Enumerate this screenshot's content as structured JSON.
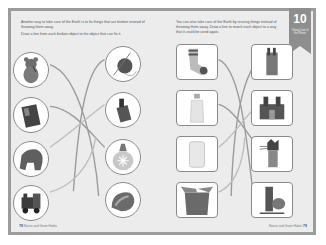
{
  "left_page": {
    "instructions": [
      "Another way to take care of the Earth is to fix things that are broken instead of throwing them away.",
      "Draw a line from each broken object to the object that can fix it."
    ],
    "broken_objects": [
      {
        "name": "torn teddy bear",
        "icon": "teddy-bear-icon"
      },
      {
        "name": "torn book",
        "icon": "book-icon"
      },
      {
        "name": "torn stuffed elephant",
        "icon": "elephant-toy-icon"
      },
      {
        "name": "broken toy train",
        "icon": "toy-train-icon"
      }
    ],
    "fixers": [
      {
        "name": "needle and thread",
        "icon": "yarn-needle-icon"
      },
      {
        "name": "glue stick",
        "icon": "glue-icon"
      },
      {
        "name": "glue bottle",
        "icon": "glue-bottle-icon"
      },
      {
        "name": "tape",
        "icon": "tape-icon"
      }
    ],
    "footer": {
      "page_number": "78",
      "text": "Nature and Green Habits"
    }
  },
  "right_page": {
    "instructions": [
      "You can also take care of the Earth by reusing things instead of throwing them away. Draw a line to match each object to a way that it could be used again."
    ],
    "objects": [
      {
        "name": "old sock",
        "icon": "sock-icon"
      },
      {
        "name": "plastic bottle",
        "icon": "plastic-bottle-icon"
      },
      {
        "name": "plastic container",
        "icon": "plastic-container-icon"
      },
      {
        "name": "cardboard box",
        "icon": "cardboard-box-icon"
      }
    ],
    "reuses": [
      {
        "name": "pencil holder",
        "icon": "pencil-holder-icon"
      },
      {
        "name": "cardboard castle",
        "icon": "castle-icon"
      },
      {
        "name": "sock puppet cat",
        "icon": "sock-puppet-icon"
      },
      {
        "name": "bottle hen craft",
        "icon": "hen-craft-icon"
      }
    ],
    "footer": {
      "page_number": "79",
      "text": "Nature and Green Habits"
    }
  },
  "ribbon": {
    "number": "10",
    "subtitle": "Taking Care of the Planet",
    "color": "#8e8e8e"
  },
  "colors": {
    "frame": "#9c9c9c",
    "page": "#ececec",
    "line": "#9a9a9a",
    "line_light": "#bdbdbd"
  }
}
